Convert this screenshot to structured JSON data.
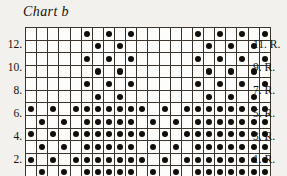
{
  "chart_title": "Chart b",
  "grid": {
    "columns": 22,
    "rows": 12,
    "dot_color": "#100d0a",
    "cell_background": "#fdfdfb",
    "line_color": "#3a342c"
  },
  "left_labels": [
    {
      "text": "12.",
      "row_from_top": 2
    },
    {
      "text": "10.",
      "row_from_top": 4
    },
    {
      "text": "8.",
      "row_from_top": 6
    },
    {
      "text": "6.",
      "row_from_top": 8
    },
    {
      "text": "4.",
      "row_from_top": 10
    },
    {
      "text": "2.",
      "row_from_top": 12
    }
  ],
  "right_labels": [
    {
      "text": "11. R.",
      "row_from_top": 2
    },
    {
      "text": "9. R.",
      "row_from_top": 4
    },
    {
      "text": "7. R.",
      "row_from_top": 6
    },
    {
      "text": "5. R.",
      "row_from_top": 8
    },
    {
      "text": "3. R.",
      "row_from_top": 10
    },
    {
      "text": "1. R.",
      "row_from_top": 12
    }
  ],
  "chart_data": {
    "type": "heatmap",
    "title": "Chart b",
    "xlabel": "",
    "ylabel": "",
    "legend": [],
    "grid": true,
    "categories": [
      1,
      2,
      3,
      4,
      5,
      6,
      7,
      8,
      9,
      10,
      11,
      12,
      13,
      14,
      15,
      16,
      17,
      18,
      19,
      20,
      21,
      22
    ],
    "cells": [
      [
        0,
        0,
        0,
        0,
        0,
        1,
        0,
        1,
        0,
        1,
        0,
        0,
        0,
        0,
        0,
        1,
        0,
        1,
        0,
        1,
        0,
        1
      ],
      [
        0,
        0,
        0,
        0,
        0,
        0,
        1,
        0,
        1,
        0,
        0,
        0,
        0,
        0,
        0,
        0,
        1,
        0,
        1,
        0,
        1,
        0
      ],
      [
        0,
        0,
        0,
        0,
        0,
        1,
        0,
        1,
        0,
        1,
        0,
        0,
        0,
        0,
        0,
        1,
        0,
        1,
        0,
        1,
        0,
        1
      ],
      [
        0,
        0,
        0,
        0,
        0,
        0,
        1,
        0,
        1,
        0,
        0,
        0,
        0,
        0,
        0,
        0,
        1,
        0,
        1,
        0,
        1,
        0
      ],
      [
        0,
        0,
        0,
        0,
        0,
        1,
        0,
        1,
        0,
        1,
        0,
        0,
        0,
        0,
        0,
        1,
        0,
        1,
        0,
        1,
        0,
        1
      ],
      [
        0,
        0,
        0,
        0,
        0,
        0,
        1,
        0,
        1,
        0,
        0,
        0,
        0,
        0,
        0,
        0,
        1,
        0,
        1,
        0,
        1,
        0
      ],
      [
        1,
        0,
        1,
        0,
        1,
        1,
        1,
        1,
        1,
        1,
        1,
        0,
        1,
        0,
        1,
        1,
        1,
        1,
        1,
        1,
        1,
        1
      ],
      [
        0,
        1,
        0,
        1,
        0,
        1,
        1,
        1,
        1,
        1,
        0,
        1,
        0,
        1,
        0,
        1,
        1,
        1,
        1,
        1,
        1,
        1
      ],
      [
        1,
        0,
        1,
        0,
        1,
        1,
        1,
        1,
        1,
        1,
        1,
        0,
        1,
        0,
        1,
        1,
        1,
        1,
        1,
        1,
        1,
        1
      ],
      [
        0,
        1,
        0,
        1,
        0,
        1,
        1,
        1,
        1,
        1,
        0,
        1,
        0,
        1,
        0,
        1,
        1,
        1,
        1,
        1,
        1,
        1
      ],
      [
        1,
        0,
        1,
        0,
        1,
        1,
        1,
        1,
        1,
        1,
        1,
        0,
        1,
        0,
        1,
        1,
        1,
        1,
        1,
        1,
        1,
        1
      ],
      [
        0,
        1,
        0,
        1,
        0,
        1,
        1,
        1,
        1,
        1,
        0,
        1,
        0,
        1,
        0,
        1,
        1,
        1,
        1,
        1,
        1,
        1
      ]
    ],
    "row_labels_left": [
      "",
      "12.",
      "",
      "10.",
      "",
      "8.",
      "",
      "6.",
      "",
      "4.",
      "",
      "2."
    ],
    "row_labels_right": [
      "",
      "11. R.",
      "",
      "9. R.",
      "",
      "7. R.",
      "",
      "5. R.",
      "",
      "3. R.",
      "",
      "1. R."
    ]
  }
}
